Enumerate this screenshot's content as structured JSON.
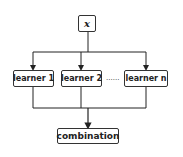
{
  "diagram": {
    "input": {
      "label": "x"
    },
    "learners": [
      {
        "label": "learner 1"
      },
      {
        "label": "learner 2"
      },
      {
        "label": "learner n"
      }
    ],
    "ellipsis": "......",
    "output": {
      "label": "combination"
    },
    "colors": {
      "line": "#222222",
      "box_border": "#333333",
      "text": "#222222"
    }
  }
}
